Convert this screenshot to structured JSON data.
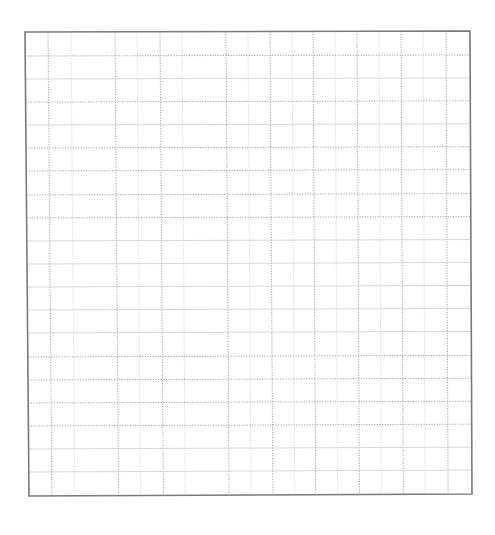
{
  "sheet": {
    "type": "grid-paper",
    "border": {
      "corners": {
        "tl": [
          25,
          32
        ],
        "tr": [
          470,
          31
        ],
        "br": [
          472,
          494
        ],
        "bl": [
          29,
          496
        ]
      },
      "color": "#7a7a7a",
      "width": 1.6
    },
    "line_color_dotted": "#9a9a9a",
    "line_color_solid": "#d2d2d2",
    "vertical_lines": [
      48,
      71,
      115,
      137,
      160,
      182,
      226,
      248,
      270,
      292,
      313,
      335,
      357,
      379,
      401,
      423,
      446
    ],
    "horizontal_lines": [
      {
        "y": 56,
        "style": "dotted"
      },
      {
        "y": 79,
        "style": "solid"
      },
      {
        "y": 102,
        "style": "dotted"
      },
      {
        "y": 125,
        "style": "solid"
      },
      {
        "y": 148,
        "style": "dotted"
      },
      {
        "y": 171,
        "style": "dotted"
      },
      {
        "y": 195,
        "style": "dotted"
      },
      {
        "y": 218,
        "style": "dotted"
      },
      {
        "y": 241,
        "style": "solid"
      },
      {
        "y": 264,
        "style": "solid"
      },
      {
        "y": 287,
        "style": "solid"
      },
      {
        "y": 310,
        "style": "solid"
      },
      {
        "y": 333,
        "style": "solid"
      },
      {
        "y": 357,
        "style": "dotted"
      },
      {
        "y": 380,
        "style": "dotted"
      },
      {
        "y": 403,
        "style": "dotted"
      },
      {
        "y": 426,
        "style": "dotted"
      },
      {
        "y": 449,
        "style": "solid"
      },
      {
        "y": 472,
        "style": "solid"
      }
    ]
  }
}
